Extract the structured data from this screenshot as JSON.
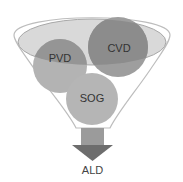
{
  "diagram": {
    "type": "funnel",
    "inputs": [
      {
        "label": "PVD",
        "color": "#9a9a9a"
      },
      {
        "label": "CVD",
        "color": "#8e8e8e"
      },
      {
        "label": "SOG",
        "color": "#b4b4b4"
      }
    ],
    "output": {
      "label": "ALD"
    },
    "colors": {
      "funnel_outline": "#b8b8b8",
      "inner_ellipse_fill": "#d6d6d6",
      "arrow_top": "#9b9b9b",
      "arrow_head": "#6f6f6f"
    }
  }
}
